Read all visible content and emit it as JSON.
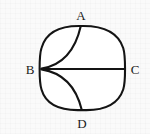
{
  "figure": {
    "stroke_color": "#141414",
    "fill_color": "#ffffff",
    "background_color": "#fafafa",
    "label_color": "#1a1a1a",
    "stroke_width": 2.1,
    "canvas": {
      "width": 150,
      "height": 134
    },
    "vertices": [
      {
        "id": "A",
        "label": "A",
        "x": 81,
        "y": 26,
        "label_x": 81,
        "label_y": 19,
        "position": "top"
      },
      {
        "id": "B",
        "label": "B",
        "x": 41,
        "y": 69,
        "label_x": 31,
        "label_y": 73,
        "position": "left"
      },
      {
        "id": "C",
        "label": "C",
        "x": 124,
        "y": 69,
        "label_x": 134,
        "label_y": 73,
        "position": "right"
      },
      {
        "id": "D",
        "label": "D",
        "x": 82,
        "y": 110,
        "label_x": 82,
        "label_y": 126,
        "position": "bottom"
      }
    ],
    "edges": [
      {
        "id": "chord-BC",
        "from": "B",
        "to": "C",
        "kind": "straight"
      },
      {
        "id": "arc-BA",
        "from": "B",
        "to": "A",
        "kind": "arc",
        "curvature": "concave-right"
      },
      {
        "id": "arc-BD",
        "from": "B",
        "to": "D",
        "kind": "arc",
        "curvature": "concave-right"
      }
    ],
    "outline": {
      "id": "rounded-square-outline",
      "kind": "rounded-square",
      "left": 41,
      "right": 124,
      "top": 26,
      "bottom": 110,
      "corner_radius": 26
    }
  }
}
